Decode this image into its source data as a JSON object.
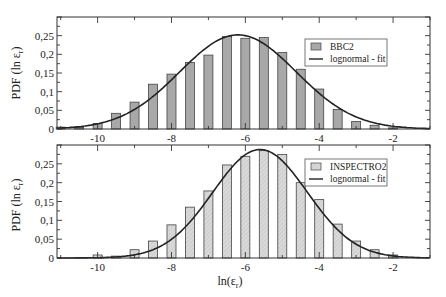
{
  "chart_data": [
    {
      "type": "bar",
      "panel": "top",
      "title": "",
      "xlabel": "",
      "ylabel": "PDF (ln ε_r)",
      "xlim": [
        -11.1,
        -1.0
      ],
      "ylim": [
        0,
        0.3
      ],
      "xticks": [
        -10,
        -8,
        -6,
        -4,
        -2
      ],
      "xtick_labels": [
        "-10",
        "-8",
        "-6",
        "-4",
        "-2"
      ],
      "yticks": [
        0,
        0.05,
        0.1,
        0.15,
        0.2,
        0.25
      ],
      "ytick_labels": [
        "0",
        "0,05",
        "0,1",
        "0,15",
        "0,2",
        "0,25"
      ],
      "legend_position": "upper right",
      "bar_color": "#a8a8a8",
      "series": [
        {
          "name": "BBC2",
          "kind": "bar",
          "x": [
            -11,
            -10.5,
            -10,
            -9.5,
            -9,
            -8.5,
            -8,
            -7.5,
            -7,
            -6.5,
            -6,
            -5.5,
            -5,
            -4.5,
            -4,
            -3.5,
            -3,
            -2.5,
            -2
          ],
          "values": [
            0.005,
            0.004,
            0.015,
            0.042,
            0.072,
            0.12,
            0.147,
            0.178,
            0.198,
            0.248,
            0.243,
            0.245,
            0.205,
            0.16,
            0.107,
            0.052,
            0.02,
            0.01,
            0.003
          ]
        },
        {
          "name": "lognormal - fit",
          "kind": "line",
          "mean": -6.2,
          "sigma": 1.58,
          "peak": 0.252
        }
      ]
    },
    {
      "type": "bar",
      "panel": "bottom",
      "title": "",
      "xlabel": "ln(ε_r)",
      "ylabel": "PDF (ln ε_r)",
      "xlim": [
        -11.1,
        -1.0
      ],
      "ylim": [
        0,
        0.3
      ],
      "xticks": [
        -10,
        -8,
        -6,
        -4,
        -2
      ],
      "xtick_labels": [
        "-10",
        "-8",
        "-6",
        "-4",
        "-2"
      ],
      "yticks": [
        0,
        0.05,
        0.1,
        0.15,
        0.2,
        0.25
      ],
      "ytick_labels": [
        "0",
        "0,05",
        "0,1",
        "0,15",
        "0,2",
        "0,25"
      ],
      "legend_position": "upper right",
      "bar_color": "#d4d4d4",
      "series": [
        {
          "name": "INSPECTRO2",
          "kind": "bar",
          "x": [
            -10,
            -9.5,
            -9,
            -8.5,
            -8,
            -7.5,
            -7,
            -6.5,
            -6,
            -5.5,
            -5,
            -4.5,
            -4,
            -3.5,
            -3,
            -2.5,
            -2
          ],
          "values": [
            0.008,
            0.005,
            0.022,
            0.045,
            0.088,
            0.135,
            0.178,
            0.247,
            0.27,
            0.285,
            0.275,
            0.2,
            0.155,
            0.09,
            0.045,
            0.022,
            0.008
          ]
        },
        {
          "name": "lognormal - fit",
          "kind": "line",
          "mean": -5.6,
          "sigma": 1.28,
          "peak": 0.288
        }
      ]
    }
  ],
  "labels": {
    "top_ylabel_main": "PDF (ln ε",
    "top_ylabel_sub": "r",
    "top_ylabel_end": ")",
    "bottom_ylabel_main": "PDF (ln ε",
    "bottom_ylabel_sub": "r",
    "bottom_ylabel_end": ")",
    "xlabel_main": "ln(ε",
    "xlabel_sub": "r",
    "xlabel_end": ")",
    "top_legend_bar": "BBC2",
    "top_legend_line": "lognormal - fit",
    "bottom_legend_bar": "INSPECTRO2",
    "bottom_legend_line": "lognormal - fit"
  }
}
